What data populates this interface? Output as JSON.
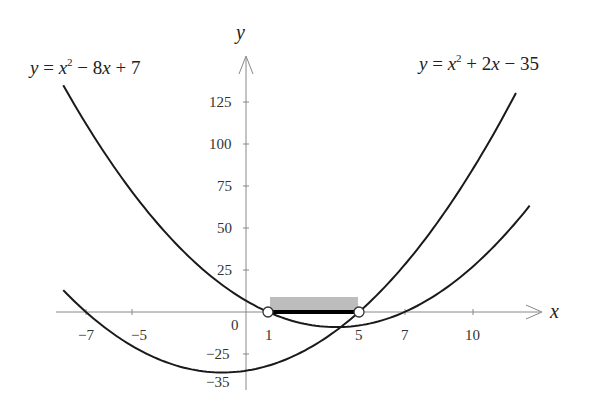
{
  "chart_data": {
    "type": "line",
    "title": "",
    "xlabel": "x",
    "ylabel": "y",
    "xlim": [
      -8.5,
      13.5
    ],
    "ylim": [
      -40,
      140
    ],
    "grid": false,
    "x_ticks": [
      -7,
      -5,
      1,
      5,
      7,
      10
    ],
    "x_tick_labels": [
      "−7",
      "−5",
      "1",
      "5",
      "7",
      "10"
    ],
    "y_ticks": [
      125,
      100,
      75,
      50,
      25,
      -25,
      -35
    ],
    "y_tick_labels": [
      "125",
      "100",
      "75",
      "50",
      "25",
      "−25",
      "−35"
    ],
    "origin_label": "0",
    "series": [
      {
        "name": "y = x^2 - 8x + 7",
        "label_parts": {
          "lhs": "y",
          "eq": " = ",
          "x": "x",
          "sup": "2",
          "rest": " − 8",
          "x2": "x",
          "tail": " + 7"
        },
        "x_range": [
          -8,
          12.5
        ],
        "roots": [
          1,
          7
        ],
        "vertex": [
          4,
          -9
        ],
        "y_intercept": 7
      },
      {
        "name": "y = x^2 + 2x - 35",
        "label_parts": {
          "lhs": "y",
          "eq": " = ",
          "x": "x",
          "sup": "2",
          "rest": " + 2",
          "x2": "x",
          "tail": " − 35"
        },
        "x_range": [
          -8,
          11.9
        ],
        "roots": [
          -7,
          5
        ],
        "vertex": [
          -1,
          -36
        ],
        "y_intercept": -35
      }
    ],
    "annotations": {
      "open_circles": [
        [
          1,
          0
        ],
        [
          5,
          0
        ]
      ],
      "highlighted_interval": {
        "from": 1,
        "to": 5,
        "style": "thick black segment with gray shaded band above"
      }
    }
  },
  "labels": {
    "eq1": {
      "y": "y",
      "eqsign": " = ",
      "x": "x",
      "sup": "2",
      "mid": " − 8",
      "x2": "x",
      "tail": " + 7"
    },
    "eq2": {
      "y": "y",
      "eqsign": " = ",
      "x": "x",
      "sup": "2",
      "mid": " + 2",
      "x2": "x",
      "tail": " − 35"
    },
    "x_axis": "x",
    "y_axis": "y",
    "origin": "0",
    "x_ticks": {
      "m7": "−7",
      "m5": "−5",
      "p1": "1",
      "p5": "5",
      "p7": "7",
      "p10": "10"
    },
    "y_ticks": {
      "p125": "125",
      "p100": "100",
      "p75": "75",
      "p50": "50",
      "p25": "25",
      "m25": "−25",
      "m35": "−35"
    }
  }
}
